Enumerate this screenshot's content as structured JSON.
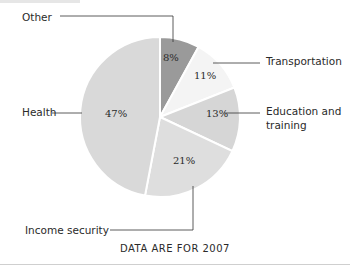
{
  "chart_data": {
    "type": "pie",
    "title": "",
    "footnote": "DATA ARE FOR 2007",
    "slices": [
      {
        "label": "Other",
        "value": 8,
        "display": "8%",
        "color": "#9a9a9a"
      },
      {
        "label": "Transportation",
        "value": 11,
        "display": "11%",
        "color": "#f4f4f4"
      },
      {
        "label": "Education and training",
        "value": 13,
        "display": "13%",
        "color": "#d6d6d6"
      },
      {
        "label": "Income security",
        "value": 21,
        "display": "21%",
        "color": "#dedede"
      },
      {
        "label": "Health",
        "value": 47,
        "display": "47%",
        "color": "#d9d9d9"
      }
    ],
    "start_angle_deg": 0,
    "direction": "clockwise",
    "legend_position": "callout labels"
  },
  "labels": {
    "other": "Other",
    "transportation": "Transportation",
    "education_line1": "Education and",
    "education_line2": "training",
    "health": "Health",
    "income": "Income security"
  },
  "percents": {
    "other": "8%",
    "transportation": "11%",
    "education": "13%",
    "income": "21%",
    "health": "47%"
  },
  "footnote": "DATA ARE FOR 2007"
}
